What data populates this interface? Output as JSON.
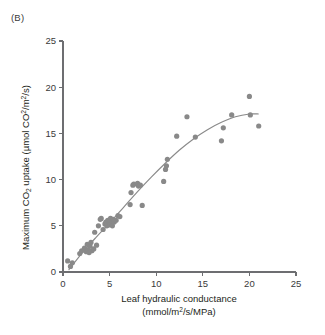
{
  "figure": {
    "panel_label": "(B)",
    "background_color": "#ffffff",
    "point_color": "#898989",
    "curve_color": "#8a8a8a",
    "axis_color": "#6d6e71"
  },
  "chart_data": {
    "type": "scatter",
    "title": "",
    "panel": "(B)",
    "xlabel_line1": "Leaf hydraulic conductance",
    "xlabel_line2": "(mmol/m²/s/MPa)",
    "ylabel": "Maximum CO₂ uptake (µmol CO²/m²/s)",
    "ylabel_parts": {
      "prefix": "Maximum CO",
      "sub1": "2",
      "mid": " uptake (µmol CO",
      "sup1": "2",
      "mid2": "/m",
      "sup2": "2",
      "suffix": "/s)"
    },
    "xlim": [
      0,
      25
    ],
    "ylim": [
      0,
      25
    ],
    "xticks": [
      0,
      5,
      10,
      15,
      20,
      25
    ],
    "yticks": [
      0,
      5,
      10,
      15,
      20,
      25
    ],
    "xtick_labels": [
      "0",
      "5",
      "10",
      "15",
      "20",
      "25"
    ],
    "ytick_labels": [
      "0",
      "5",
      "10",
      "15",
      "20",
      "25"
    ],
    "grid": false,
    "legend": false,
    "marker": "circle",
    "points": [
      [
        0.5,
        1.2
      ],
      [
        0.8,
        0.6
      ],
      [
        1.0,
        1.0
      ],
      [
        1.8,
        2.0
      ],
      [
        2.0,
        2.3
      ],
      [
        2.3,
        2.6
      ],
      [
        2.5,
        2.2
      ],
      [
        2.6,
        3.0
      ],
      [
        2.7,
        2.4
      ],
      [
        2.8,
        2.1
      ],
      [
        2.9,
        2.8
      ],
      [
        3.0,
        3.2
      ],
      [
        3.1,
        2.3
      ],
      [
        3.3,
        2.5
      ],
      [
        3.4,
        4.3
      ],
      [
        3.6,
        2.9
      ],
      [
        3.8,
        5.0
      ],
      [
        4.0,
        5.7
      ],
      [
        4.1,
        5.8
      ],
      [
        4.3,
        4.6
      ],
      [
        4.5,
        5.2
      ],
      [
        4.6,
        5.4
      ],
      [
        4.7,
        5.0
      ],
      [
        4.8,
        5.6
      ],
      [
        4.9,
        5.1
      ],
      [
        5.0,
        5.3
      ],
      [
        5.1,
        5.8
      ],
      [
        5.2,
        5.5
      ],
      [
        5.3,
        5.0
      ],
      [
        5.4,
        5.7
      ],
      [
        5.5,
        5.4
      ],
      [
        5.7,
        5.6
      ],
      [
        5.9,
        6.1
      ],
      [
        6.1,
        6.0
      ],
      [
        7.2,
        7.3
      ],
      [
        7.3,
        8.6
      ],
      [
        7.5,
        9.4
      ],
      [
        7.6,
        9.5
      ],
      [
        8.0,
        9.6
      ],
      [
        8.1,
        9.3
      ],
      [
        8.3,
        9.4
      ],
      [
        8.5,
        7.2
      ],
      [
        10.8,
        9.8
      ],
      [
        11.0,
        11.1
      ],
      [
        11.1,
        11.5
      ],
      [
        11.2,
        12.2
      ],
      [
        12.2,
        14.7
      ],
      [
        13.3,
        16.8
      ],
      [
        14.2,
        14.6
      ],
      [
        17.0,
        14.2
      ],
      [
        17.2,
        15.6
      ],
      [
        18.1,
        17.0
      ],
      [
        20.0,
        19.0
      ],
      [
        20.1,
        17.0
      ],
      [
        21.0,
        15.8
      ]
    ],
    "fit_curve": {
      "description": "saturating quadratic fit",
      "points": [
        [
          0.6,
          0.2
        ],
        [
          2.0,
          2.0
        ],
        [
          3.5,
          3.7
        ],
        [
          5.0,
          5.3
        ],
        [
          6.5,
          7.0
        ],
        [
          8.0,
          8.7
        ],
        [
          9.5,
          10.3
        ],
        [
          11.0,
          11.8
        ],
        [
          12.5,
          13.2
        ],
        [
          14.0,
          14.4
        ],
        [
          15.5,
          15.4
        ],
        [
          17.0,
          16.2
        ],
        [
          18.5,
          16.8
        ],
        [
          20.0,
          17.1
        ],
        [
          21.0,
          17.1
        ]
      ]
    }
  }
}
